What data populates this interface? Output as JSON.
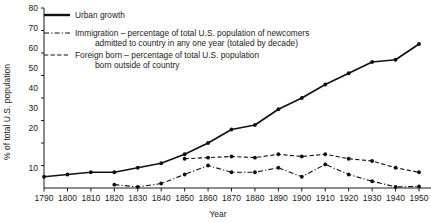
{
  "chart_data": {
    "type": "line",
    "title": "",
    "xlabel": "Year",
    "ylabel": "% of total U.S. population",
    "xlim": [
      1790,
      1950
    ],
    "ylim": [
      0,
      80
    ],
    "grid": false,
    "legend_position": "top-left",
    "x": [
      1790,
      1800,
      1810,
      1820,
      1830,
      1840,
      1850,
      1860,
      1870,
      1880,
      1890,
      1900,
      1910,
      1920,
      1930,
      1940,
      1950
    ],
    "xticklabels": [
      "1790",
      "1800",
      "1810",
      "1820",
      "1830",
      "1840",
      "1850",
      "1860",
      "1870",
      "1880",
      "1890",
      "1900",
      "1910",
      "1920",
      "1930",
      "1940",
      "1950"
    ],
    "yticks": [
      0,
      10,
      20,
      30,
      40,
      50,
      60,
      70,
      80
    ],
    "yticklabels": [
      "",
      "10",
      "20",
      "30",
      "40",
      "50",
      "60",
      "70",
      "80"
    ],
    "series": [
      {
        "name": "Urban growth",
        "style": "solid",
        "x": [
          1790,
          1800,
          1810,
          1820,
          1830,
          1840,
          1850,
          1860,
          1870,
          1880,
          1890,
          1900,
          1910,
          1920,
          1930,
          1940,
          1950
        ],
        "values": [
          5,
          6,
          7,
          7,
          9,
          11,
          15,
          20,
          26,
          28,
          35,
          40,
          46,
          51,
          56,
          57,
          64
        ]
      },
      {
        "name": "Immigration",
        "style": "dash-dot",
        "x": [
          1820,
          1830,
          1840,
          1850,
          1860,
          1870,
          1880,
          1890,
          1900,
          1910,
          1920,
          1930,
          1940,
          1950
        ],
        "values": [
          1.5,
          0.5,
          2,
          6,
          10,
          7,
          7,
          9,
          5,
          10.5,
          6,
          3,
          0.5,
          0.7
        ]
      },
      {
        "name": "Foreign born",
        "style": "dashed",
        "x": [
          1850,
          1860,
          1870,
          1880,
          1890,
          1900,
          1910,
          1920,
          1930,
          1940,
          1950
        ],
        "values": [
          13,
          13.5,
          14,
          13.5,
          15,
          14,
          15,
          13,
          12,
          9,
          7
        ]
      }
    ]
  },
  "legend": {
    "items": [
      {
        "key": "urban-growth",
        "style": "solid",
        "lines": [
          "Urban growth"
        ]
      },
      {
        "key": "immigration",
        "style": "dash-dot",
        "lines": [
          "Immigration – percentage of total U.S. population of newcomers",
          "admitted to country in any one year (totaled by decade)"
        ]
      },
      {
        "key": "foreign-born",
        "style": "dashed",
        "lines": [
          "Foreign born – percentage of total U.S. population",
          "born outside of country"
        ]
      }
    ]
  },
  "axes": {
    "y_title": "% of total U.S. population",
    "x_title": "Year",
    "y_labels": [
      "80",
      "70",
      "60",
      "50",
      "40",
      "30",
      "20",
      "10"
    ],
    "x_labels": [
      "1790",
      "1800",
      "1810",
      "1820",
      "1830",
      "1840",
      "1850",
      "1860",
      "1870",
      "1880",
      "1890",
      "1900",
      "1910",
      "1920",
      "1930",
      "1940",
      "1950"
    ]
  }
}
